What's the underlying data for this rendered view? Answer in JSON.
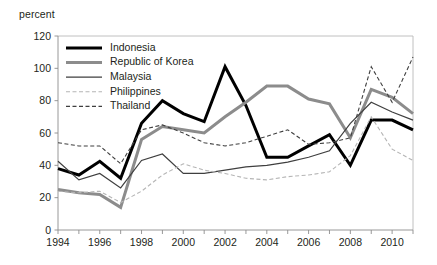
{
  "axis_unit_label": "percent",
  "chart_data": {
    "type": "line",
    "title": "",
    "subtitle": "",
    "xlabel": "",
    "ylabel": "percent",
    "ylim": [
      0,
      120
    ],
    "ytick_values": [
      0,
      20,
      40,
      60,
      80,
      100,
      120
    ],
    "ytick_labels": [
      "0",
      "20",
      "40",
      "60",
      "80",
      "100",
      "120"
    ],
    "xlim": [
      1994,
      2011
    ],
    "x": [
      1994,
      1995,
      1996,
      1997,
      1998,
      1999,
      2000,
      2001,
      2002,
      2003,
      2004,
      2005,
      2006,
      2007,
      2008,
      2009,
      2010,
      2011
    ],
    "xtick_values": [
      1994,
      1995,
      1996,
      1997,
      1998,
      1999,
      2000,
      2001,
      2002,
      2003,
      2004,
      2005,
      2006,
      2007,
      2008,
      2009,
      2010,
      2011
    ],
    "xtick_labels": [
      "1994",
      "",
      "1996",
      "",
      "1998",
      "",
      "2000",
      "",
      "2002",
      "",
      "2004",
      "",
      "2006",
      "",
      "2008",
      "",
      "2010",
      ""
    ],
    "grid": false,
    "legend_position": "top-left",
    "series": [
      {
        "name": "Indonesia",
        "color": "#000000",
        "width": 3.0,
        "dash": "none",
        "values": [
          38,
          34,
          42.5,
          32,
          66,
          80,
          72,
          67,
          101,
          77,
          45,
          45,
          52,
          59,
          40,
          68,
          68,
          62
        ]
      },
      {
        "name": "Republic of Korea",
        "color": "#8c8c8c",
        "width": 3.0,
        "dash": "none",
        "values": [
          25,
          23,
          22,
          14,
          56,
          64,
          62,
          60,
          70,
          79,
          89,
          89,
          81,
          78,
          57,
          87,
          82,
          72
        ]
      },
      {
        "name": "Malaysia",
        "color": "#3f3f3f",
        "width": 1.2,
        "dash": "none",
        "values": [
          42.5,
          31,
          35,
          26,
          43,
          47,
          35,
          35,
          37,
          39,
          40,
          42,
          45,
          49,
          66,
          79,
          73,
          68
        ]
      },
      {
        "name": "Philippines",
        "color": "#b5b5b5",
        "width": 1.1,
        "dash": "4,2.5",
        "values": [
          24,
          23,
          24,
          17,
          24,
          34,
          41,
          37,
          35,
          32,
          31,
          33,
          34,
          36,
          46,
          70,
          50,
          43
        ]
      },
      {
        "name": "Thailand",
        "color": "#3f3f3f",
        "width": 1.1,
        "dash": "4,2.5",
        "values": [
          54,
          52,
          52,
          41,
          62,
          65,
          60,
          54,
          52,
          54,
          58,
          62,
          53,
          54,
          57,
          101,
          79,
          107
        ]
      }
    ],
    "legend": [
      {
        "label": "Indonesia"
      },
      {
        "label": "Republic of Korea"
      },
      {
        "label": "Malaysia"
      },
      {
        "label": "Philippines"
      },
      {
        "label": "Thailand"
      }
    ]
  }
}
